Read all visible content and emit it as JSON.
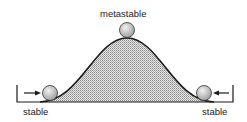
{
  "diagram": {
    "labels": {
      "top": "metastable",
      "left": "stable",
      "right": "stable"
    },
    "colors": {
      "line": "#1a1a1a",
      "fill": "#bdbdbd",
      "ball": "#d6d6d6"
    }
  }
}
